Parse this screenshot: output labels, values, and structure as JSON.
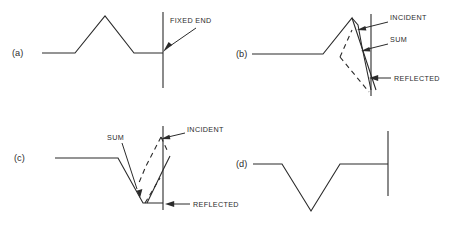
{
  "figure": {
    "background_color": "#ffffff",
    "line_color": "#2b2b2b",
    "width": 456,
    "height": 229
  },
  "panels": [
    {
      "id": "a",
      "label": "(a)",
      "description": "Upward pulse travelling right toward the fixed end",
      "annotations": [
        {
          "id": "fixed-end",
          "text": "FIXED END"
        }
      ]
    },
    {
      "id": "b",
      "label": "(b)",
      "description": "Incident and inverted reflected pulses overlapping at the wall, with their sum",
      "annotations": [
        {
          "id": "incident",
          "text": "INCIDENT"
        },
        {
          "id": "sum",
          "text": "SUM"
        },
        {
          "id": "reflected",
          "text": "REFLECTED"
        }
      ]
    },
    {
      "id": "c",
      "label": "(c)",
      "description": "Reflected inverted pulse emerging as the incident pulse passes the wall",
      "annotations": [
        {
          "id": "sum",
          "text": "SUM"
        },
        {
          "id": "incident",
          "text": "INCIDENT"
        },
        {
          "id": "reflected",
          "text": "REFLECTED"
        }
      ]
    },
    {
      "id": "d",
      "label": "(d)",
      "description": "Fully reflected inverted pulse travelling left away from the fixed end",
      "annotations": []
    }
  ],
  "labels": {
    "panel_a": "(a)",
    "panel_b": "(b)",
    "panel_c": "(c)",
    "panel_d": "(d)",
    "fixed_end": "FIXED END",
    "incident_b": "INCIDENT",
    "sum_b": "SUM",
    "reflected_b": "REFLECTED",
    "sum_c": "SUM",
    "incident_c": "INCIDENT",
    "reflected_c": "REFLECTED"
  }
}
